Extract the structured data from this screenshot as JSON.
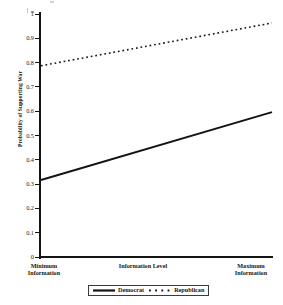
{
  "chart_data": {
    "type": "line",
    "title": "",
    "xlabel": "Information Level",
    "ylabel": "Probability of Supporting War",
    "ylim": [
      0,
      1
    ],
    "ytick_labels": [
      "1",
      "0.9",
      "0.8",
      "0.7",
      "0.6",
      "0.5",
      "0.4",
      "0.3",
      "0.2",
      "0.1",
      "0"
    ],
    "ytick_values": [
      1,
      0.9,
      0.8,
      0.7,
      0.6,
      0.5,
      0.4,
      0.3,
      0.2,
      0.1,
      0
    ],
    "x": [
      0,
      1
    ],
    "xtick_labels": [
      "Minimum\nInformation",
      "Maximum\nInformation"
    ],
    "grid": false,
    "legend_position": "bottom",
    "series": [
      {
        "name": "Democrat",
        "style": "solid",
        "color": "#141414",
        "values": [
          0.317,
          0.596
        ]
      },
      {
        "name": "Republican",
        "style": "dotted",
        "color": "#141414",
        "values": [
          0.787,
          0.963
        ]
      }
    ]
  },
  "axes": {
    "y_title": "Probability of Supporting War",
    "x_title": "Information Level",
    "x_min_label_line1": "Minimum",
    "x_min_label_line2": "Information",
    "x_max_label_line1": "Maximum",
    "x_max_label_line2": "Information"
  },
  "legend": {
    "items": [
      {
        "label": "Democrat",
        "style": "solid"
      },
      {
        "label": "Republican",
        "style": "dotted"
      }
    ]
  }
}
